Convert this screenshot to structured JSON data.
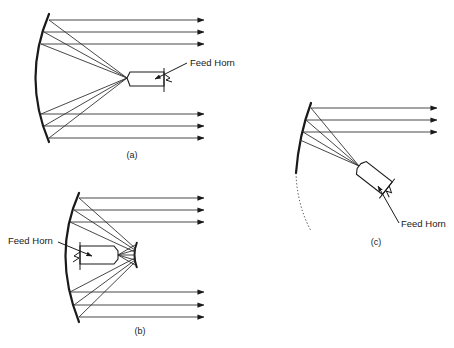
{
  "figure": {
    "panels": [
      {
        "id": "a",
        "caption": "(a)",
        "feed_label": "Feed Horn",
        "type": "front-fed parabolic reflector"
      },
      {
        "id": "b",
        "caption": "(b)",
        "feed_label": "Feed Horn",
        "type": "Cassegrain reflector with subreflector"
      },
      {
        "id": "c",
        "caption": "(c)",
        "feed_label": "Feed Horn",
        "type": "offset-fed reflector"
      }
    ]
  },
  "colors": {
    "line": "#1a1a1a",
    "background": "#ffffff"
  }
}
